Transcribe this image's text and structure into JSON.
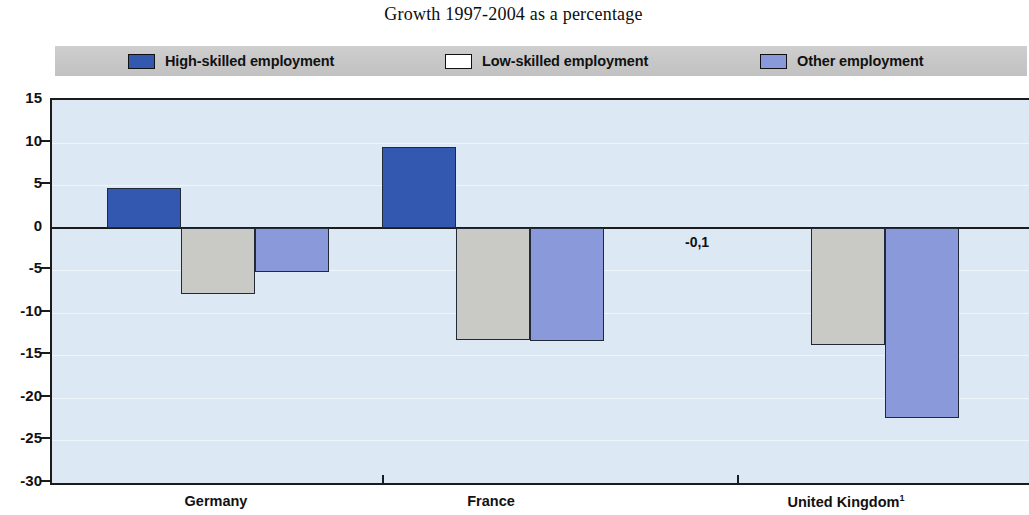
{
  "chart_data": {
    "type": "bar",
    "title": "Growth 1997-2004 as a percentage",
    "xlabel": "",
    "ylabel": "",
    "ylim": [
      -30,
      15
    ],
    "ytick_values": [
      15,
      10,
      5,
      0,
      -5,
      -10,
      -15,
      -20,
      -25,
      -30
    ],
    "ytick_labels": [
      "15",
      "10",
      "5",
      "0",
      "-5",
      "-10",
      "-15",
      "-20",
      "-25",
      "-30"
    ],
    "grid": true,
    "legend_position": "top",
    "categories": [
      "Germany",
      "France",
      "United Kingdom"
    ],
    "category_labels": [
      "Germany",
      "France",
      "United Kingdom"
    ],
    "category_footnotes": [
      "",
      "",
      "1"
    ],
    "series": [
      {
        "name": "High-skilled employment",
        "key": "high",
        "color": "#3358b0",
        "values": [
          4.7,
          9.5,
          -0.1
        ],
        "data_labels": [
          "",
          "",
          "-0,1"
        ]
      },
      {
        "name": "Low-skilled employment",
        "key": "low",
        "color": "#c9c9c5",
        "values": [
          -7.8,
          -13.2,
          -13.8
        ],
        "data_labels": [
          "",
          "",
          ""
        ]
      },
      {
        "name": "Other employment",
        "key": "other",
        "color": "#8a99d9",
        "values": [
          -5.2,
          -13.3,
          -22.4
        ],
        "data_labels": [
          "",
          "",
          ""
        ]
      }
    ]
  },
  "legend": {
    "items": [
      {
        "label": "High-skilled employment",
        "swatch_color": "#3358b0",
        "swatch_name": "legend-swatch-high-skilled"
      },
      {
        "label": "Low-skilled employment",
        "swatch_color": "#ffffff",
        "swatch_name": "legend-swatch-low-skilled"
      },
      {
        "label": "Other employment",
        "swatch_color": "#8a99d9",
        "swatch_name": "legend-swatch-other"
      }
    ],
    "background_color": "#c9c9c9"
  },
  "colors": {
    "plot_background": "#dce9f5",
    "axis": "#1b1b1b",
    "high_skilled": "#3358b0",
    "low_skilled": "#c9c9c5",
    "other": "#8a99d9",
    "page_background": "#ffffff"
  }
}
